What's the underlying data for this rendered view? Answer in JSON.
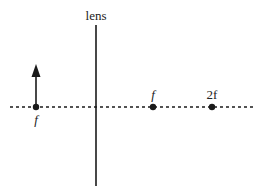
{
  "diagram": {
    "lens_label": "lens",
    "object_label": "f",
    "focal_label": "f",
    "two_focal_label": "2f",
    "colors": {
      "line": "#1a1a1a",
      "background": "#ffffff"
    }
  }
}
